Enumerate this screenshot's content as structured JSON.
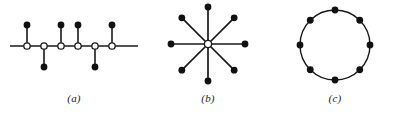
{
  "figure": {
    "width": 402,
    "height": 117,
    "background_color": "#ffffff",
    "stroke_color": "#1a1a1a",
    "node_fill_solid": "#111111",
    "node_fill_hollow": "#ffffff",
    "panels": [
      {
        "id": "a",
        "caption": "(a)",
        "type": "caterpillar-tree",
        "description": "horizontal spine with six hollow spine nodes and six solid pendant leaf nodes alternating above and below",
        "spine": {
          "y": 46,
          "x_start": 10,
          "x_end": 138,
          "nodes": [
            {
              "index": 1,
              "x": 27,
              "y": 46,
              "style": "hollow",
              "leaf_direction": "up"
            },
            {
              "index": 2,
              "x": 44,
              "y": 46,
              "style": "hollow",
              "leaf_direction": "down"
            },
            {
              "index": 3,
              "x": 61,
              "y": 46,
              "style": "hollow",
              "leaf_direction": "up"
            },
            {
              "index": 4,
              "x": 78,
              "y": 46,
              "style": "hollow",
              "leaf_direction": "up"
            },
            {
              "index": 5,
              "x": 95,
              "y": 46,
              "style": "hollow",
              "leaf_direction": "down"
            },
            {
              "index": 6,
              "x": 112,
              "y": 46,
              "style": "hollow",
              "leaf_direction": "up"
            }
          ]
        },
        "leaf_offset": 21,
        "node_radius_hollow": 3.2,
        "node_radius_solid": 3.4
      },
      {
        "id": "b",
        "caption": "(b)",
        "type": "star-graph",
        "description": "eight spokes radiating at 45 degree intervals from a hollow central hub to solid outer nodes",
        "center": {
          "x": 60,
          "y": 44,
          "style": "hollow"
        },
        "spoke_count": 8,
        "spoke_length": 37,
        "spoke_angles_deg": [
          0,
          45,
          90,
          135,
          180,
          225,
          270,
          315
        ],
        "node_radius_hollow": 3.6,
        "node_radius_solid": 3.4
      },
      {
        "id": "c",
        "caption": "(c)",
        "type": "cycle-graph",
        "description": "eight solid nodes evenly spaced on a circle connected by the circle outline",
        "center": {
          "x": 67,
          "y": 45
        },
        "radius": 35,
        "node_count": 8,
        "node_angles_deg": [
          270,
          315,
          0,
          45,
          90,
          135,
          180,
          225
        ],
        "node_radius_solid": 3.4
      }
    ]
  }
}
